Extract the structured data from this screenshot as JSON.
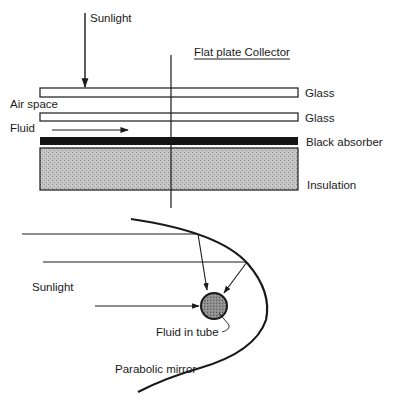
{
  "flat_plate": {
    "title": "Flat plate Collector",
    "sunlight_label": "Sunlight",
    "air_space_label": "Air space",
    "fluid_label": "Fluid",
    "layers": [
      {
        "label": "Glass"
      },
      {
        "label": "Glass"
      },
      {
        "label": "Black absorber"
      },
      {
        "label": "Insulation"
      }
    ]
  },
  "parabolic": {
    "sunlight_label": "Sunlight",
    "tube_label": "Fluid in tube",
    "mirror_label": "Parabolic mirror"
  },
  "colors": {
    "ink": "#1a1a1a",
    "absorber": "#141414",
    "insulation": "#b8b8b8",
    "tube": "#8a8a8a"
  }
}
